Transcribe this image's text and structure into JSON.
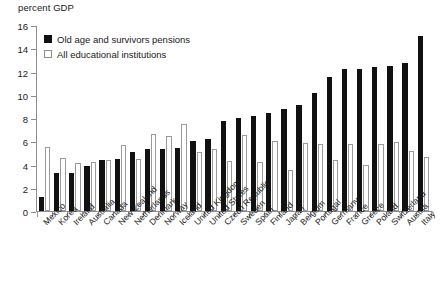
{
  "chart_data": {
    "type": "bar",
    "title": "",
    "subtitle": "",
    "xlabel": "",
    "ylabel": "percent GDP",
    "ylim": [
      0,
      16
    ],
    "yticks": [
      0,
      2,
      4,
      6,
      8,
      10,
      12,
      14,
      16
    ],
    "grid": false,
    "legend_position": "top-left",
    "categories": [
      "Mexico",
      "Korea",
      "Ireland",
      "Australia",
      "Canada",
      "New Zealand",
      "Netherlands",
      "Denmark",
      "Norway",
      "Iceland",
      "United Kingdom",
      "United States",
      "Czech Republic",
      "Sweden",
      "Spain",
      "Finland",
      "Japan",
      "Belgium",
      "Portugal",
      "Germany",
      "France",
      "Greece",
      "Poland",
      "Switzerland",
      "Austria",
      "Italy"
    ],
    "series": [
      {
        "name": "Old age and survivors pensions",
        "color": "#111111",
        "values": [
          1.2,
          3.25,
          3.3,
          3.9,
          4.35,
          4.5,
          5.1,
          5.35,
          5.35,
          5.4,
          6.05,
          6.2,
          7.75,
          8.0,
          8.2,
          8.4,
          8.75,
          9.1,
          10.15,
          11.5,
          12.2,
          12.25,
          12.4,
          12.5,
          12.75,
          15.05
        ]
      },
      {
        "name": "All educational institutions",
        "color": "#ffffff",
        "values": [
          5.5,
          4.55,
          4.15,
          4.2,
          4.4,
          5.7,
          4.45,
          6.65,
          6.45,
          7.5,
          5.1,
          5.35,
          4.3,
          6.55,
          4.2,
          6.05,
          3.5,
          5.85,
          5.75,
          4.35,
          5.8,
          3.95,
          5.75,
          5.95,
          5.15,
          4.65
        ]
      }
    ]
  },
  "legend": {
    "items": [
      {
        "label": "Old age and survivors pensions",
        "swatch": "filled-square-icon"
      },
      {
        "label": "All educational institutions",
        "swatch": "hollow-square-icon"
      }
    ]
  },
  "axis": {
    "unit_title": "percent GDP"
  }
}
